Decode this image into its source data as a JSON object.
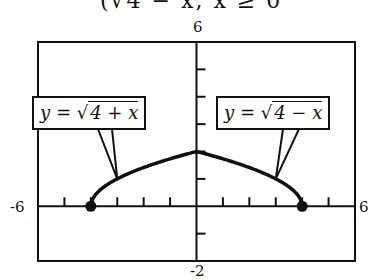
{
  "title_fragment": "(√4 − x,   x ≥ 0",
  "chart_data": {
    "type": "line",
    "title": "",
    "xlabel": "",
    "ylabel": "",
    "xlim": [
      -6,
      6
    ],
    "ylim": [
      -2,
      6
    ],
    "x_tick_step": 1,
    "y_tick_step": 1,
    "grid": false,
    "tick_labels": {
      "x_min": "-6",
      "x_max": "6",
      "y_max": "6",
      "y_min": "-2"
    },
    "series": [
      {
        "name": "y = √(4 + x)",
        "domain": [
          -4,
          0
        ],
        "x": [
          -4,
          -3,
          -2,
          -1,
          0
        ],
        "values": [
          0,
          1,
          1.41,
          1.73,
          2
        ]
      },
      {
        "name": "y = √(4 − x)",
        "domain": [
          0,
          4
        ],
        "x": [
          0,
          1,
          2,
          3,
          4
        ],
        "values": [
          2,
          1.73,
          1.41,
          1,
          0
        ]
      }
    ],
    "endpoints": [
      {
        "x": -4,
        "y": 0,
        "style": "filled-dot"
      },
      {
        "x": 4,
        "y": 0,
        "style": "filled-dot"
      }
    ],
    "annotations": [
      {
        "text_prefix": "y = ",
        "radicand": "4 + x",
        "points_to_x": -3
      },
      {
        "text_prefix": "y = ",
        "radicand": "4 − x",
        "points_to_x": 3
      }
    ]
  }
}
